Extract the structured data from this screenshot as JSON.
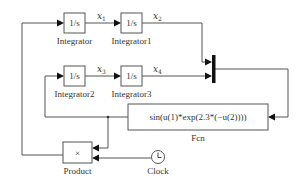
{
  "diagram": {
    "type": "simulink-block-diagram",
    "blocks": {
      "integrator": {
        "label": "Integrator",
        "content": "1/s"
      },
      "integrator1": {
        "label": "Integrator1",
        "content": "1/s"
      },
      "integrator2": {
        "label": "Integrator2",
        "content": "1/s"
      },
      "integrator3": {
        "label": "Integrator3",
        "content": "1/s"
      },
      "fcn": {
        "label": "Fcn",
        "content": "sin(u(1)*exp(2.3*(−u(2))))"
      },
      "product": {
        "label": "Product",
        "content": "×"
      },
      "clock": {
        "label": "Clock",
        "icon": "clock-icon"
      },
      "mux": {
        "label": ""
      }
    },
    "signals": {
      "x1": {
        "base": "x",
        "sub": "1"
      },
      "x2": {
        "base": "x",
        "sub": "2"
      },
      "x3": {
        "base": "x",
        "sub": "3"
      },
      "x4": {
        "base": "x",
        "sub": "4"
      }
    },
    "connections": [
      "Integrator -> Integrator1 (x1)",
      "Integrator1 -> Mux in1 (x2)",
      "Integrator2 -> Integrator3 (x3)",
      "Integrator3 -> Mux in2 (x4)",
      "Mux -> Fcn",
      "Fcn -> Integrator2",
      "Fcn -> Product in1",
      "Clock -> Product in2",
      "Product -> Integrator"
    ],
    "colors": {
      "line": "#555555",
      "arrow": "#111111",
      "background": "#ffffff"
    }
  }
}
